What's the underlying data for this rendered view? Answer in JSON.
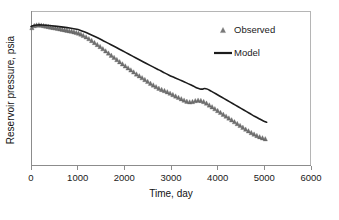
{
  "figure": {
    "background": "#ffffff",
    "plot_left": 31,
    "plot_right": 311,
    "plot_top": 11,
    "plot_bottom": 166
  },
  "chart_data": {
    "type": "line",
    "title": "",
    "subtitle": "",
    "xlabel": "Time, day",
    "ylabel": "Reservoir pressure, psia",
    "xlim": [
      0,
      6000
    ],
    "ylim": [
      0,
      1
    ],
    "xticks": [
      0,
      1000,
      2000,
      3000,
      4000,
      5000,
      6000
    ],
    "xtick_labels": [
      "0",
      "1000",
      "2000",
      "3000",
      "4000",
      "5000",
      "6000"
    ],
    "yticks": [],
    "ytick_labels": [],
    "grid": false,
    "legend_position": "top-right",
    "legend": [
      {
        "label": "Observed",
        "marker": "triangle",
        "color": "#6f6f6f"
      },
      {
        "label": "Model",
        "marker": "line",
        "color": "#1c1c1c"
      }
    ],
    "series": [
      {
        "name": "Observed",
        "marker": "triangle",
        "color": "#6f6f6f",
        "x": [
          20,
          70,
          120,
          170,
          220,
          270,
          320,
          370,
          420,
          470,
          520,
          570,
          620,
          670,
          720,
          770,
          820,
          870,
          920,
          970,
          1020,
          1070,
          1120,
          1180,
          1240,
          1300,
          1360,
          1420,
          1480,
          1540,
          1600,
          1660,
          1720,
          1780,
          1840,
          1900,
          1960,
          2020,
          2080,
          2140,
          2200,
          2260,
          2320,
          2380,
          2440,
          2500,
          2560,
          2620,
          2680,
          2740,
          2800,
          2860,
          2920,
          2980,
          3040,
          3100,
          3160,
          3220,
          3280,
          3340,
          3400,
          3460,
          3520,
          3580,
          3640,
          3700,
          3760,
          3820,
          3880,
          3940,
          4000,
          4060,
          4120,
          4180,
          4240,
          4300,
          4360,
          4420,
          4480,
          4540,
          4600,
          4660,
          4720,
          4780,
          4840,
          4900,
          4960,
          5020
        ],
        "y": [
          0.893,
          0.906,
          0.91,
          0.911,
          0.909,
          0.906,
          0.903,
          0.9,
          0.897,
          0.894,
          0.891,
          0.888,
          0.885,
          0.882,
          0.879,
          0.876,
          0.873,
          0.87,
          0.866,
          0.862,
          0.857,
          0.851,
          0.843,
          0.833,
          0.822,
          0.81,
          0.797,
          0.784,
          0.771,
          0.757,
          0.743,
          0.729,
          0.715,
          0.701,
          0.687,
          0.673,
          0.659,
          0.646,
          0.633,
          0.62,
          0.607,
          0.594,
          0.582,
          0.57,
          0.558,
          0.546,
          0.534,
          0.523,
          0.512,
          0.502,
          0.494,
          0.487,
          0.479,
          0.47,
          0.461,
          0.452,
          0.443,
          0.434,
          0.425,
          0.418,
          0.414,
          0.416,
          0.422,
          0.425,
          0.423,
          0.416,
          0.406,
          0.394,
          0.382,
          0.37,
          0.358,
          0.346,
          0.334,
          0.322,
          0.31,
          0.298,
          0.286,
          0.274,
          0.262,
          0.25,
          0.238,
          0.227,
          0.216,
          0.206,
          0.197,
          0.189,
          0.182,
          0.176
        ]
      },
      {
        "name": "Model",
        "marker": "line",
        "color": "#1c1c1c",
        "x": [
          0,
          60,
          140,
          230,
          330,
          440,
          560,
          690,
          830,
          980,
          1050,
          1140,
          1250,
          1380,
          1520,
          1660,
          1800,
          1950,
          2100,
          2250,
          2400,
          2550,
          2700,
          2780,
          2860,
          2960,
          3080,
          3200,
          3320,
          3420,
          3500,
          3560,
          3620,
          3680,
          3720,
          3780,
          3860,
          3960,
          4080,
          4200,
          4320,
          4440,
          4560,
          4680,
          4800,
          4900,
          4980,
          5050
        ],
        "y": [
          0.9,
          0.907,
          0.91,
          0.91,
          0.908,
          0.905,
          0.901,
          0.896,
          0.89,
          0.882,
          0.876,
          0.866,
          0.852,
          0.834,
          0.813,
          0.791,
          0.769,
          0.745,
          0.721,
          0.697,
          0.673,
          0.649,
          0.626,
          0.614,
          0.601,
          0.586,
          0.57,
          0.554,
          0.538,
          0.524,
          0.512,
          0.503,
          0.497,
          0.496,
          0.5,
          0.496,
          0.483,
          0.466,
          0.445,
          0.424,
          0.403,
          0.382,
          0.361,
          0.34,
          0.319,
          0.303,
          0.291,
          0.283
        ]
      }
    ]
  }
}
